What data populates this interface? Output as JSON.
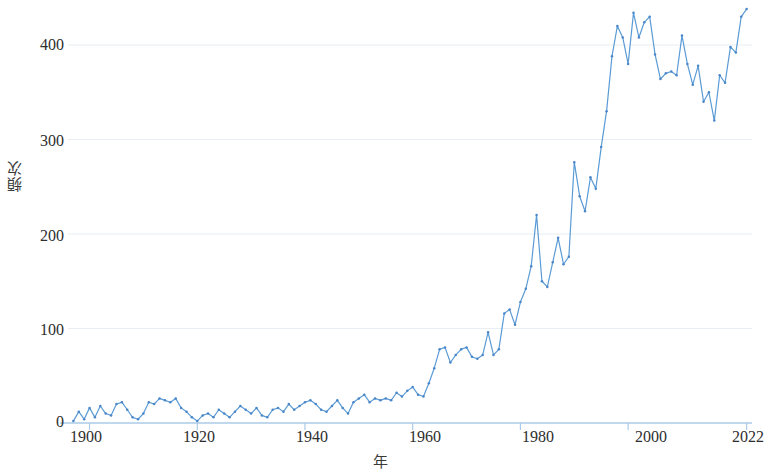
{
  "chart_data": {
    "type": "line",
    "title": "",
    "xlabel": "年",
    "ylabel": "頻次",
    "xlim": [
      1896,
      2023
    ],
    "ylim": [
      0,
      445
    ],
    "grid": true,
    "grid_axis": "y",
    "legend": null,
    "line_color": "#5b9bd5",
    "marker_color": "#4a86c8",
    "axis_color": "#aacbe8",
    "x_ticks": [
      1900,
      1920,
      1940,
      1960,
      1980,
      2000,
      2022
    ],
    "y_ticks": [
      0,
      100,
      200,
      300,
      400
    ],
    "series": [
      {
        "name": "頻次",
        "x": [
          1897,
          1898,
          1899,
          1900,
          1901,
          1902,
          1903,
          1904,
          1905,
          1906,
          1907,
          1908,
          1909,
          1910,
          1911,
          1912,
          1913,
          1914,
          1915,
          1916,
          1917,
          1918,
          1919,
          1920,
          1921,
          1922,
          1923,
          1924,
          1925,
          1926,
          1927,
          1928,
          1929,
          1930,
          1931,
          1932,
          1933,
          1934,
          1935,
          1936,
          1937,
          1938,
          1939,
          1940,
          1941,
          1942,
          1943,
          1944,
          1945,
          1946,
          1947,
          1948,
          1949,
          1950,
          1951,
          1952,
          1953,
          1954,
          1955,
          1956,
          1957,
          1958,
          1959,
          1960,
          1961,
          1962,
          1963,
          1964,
          1965,
          1966,
          1967,
          1968,
          1969,
          1970,
          1971,
          1972,
          1973,
          1974,
          1975,
          1976,
          1977,
          1978,
          1979,
          1980,
          1981,
          1982,
          1983,
          1984,
          1985,
          1986,
          1987,
          1988,
          1989,
          1990,
          1991,
          1992,
          1993,
          1994,
          1995,
          1996,
          1997,
          1998,
          1999,
          2000,
          2001,
          2002,
          2003,
          2004,
          2005,
          2006,
          2007,
          2008,
          2009,
          2010,
          2011,
          2012,
          2013,
          2014,
          2015,
          2016,
          2017,
          2018,
          2019,
          2020,
          2021,
          2022
        ],
        "values": [
          2,
          12,
          4,
          16,
          6,
          18,
          10,
          8,
          20,
          22,
          14,
          6,
          4,
          10,
          22,
          20,
          26,
          24,
          22,
          26,
          16,
          12,
          6,
          2,
          8,
          10,
          6,
          14,
          10,
          6,
          12,
          18,
          14,
          10,
          16,
          8,
          6,
          14,
          16,
          12,
          20,
          14,
          18,
          22,
          24,
          20,
          14,
          12,
          18,
          24,
          16,
          10,
          22,
          26,
          30,
          22,
          26,
          24,
          26,
          24,
          32,
          28,
          34,
          38,
          30,
          28,
          42,
          58,
          78,
          80,
          64,
          72,
          78,
          80,
          70,
          68,
          72,
          96,
          72,
          78,
          116,
          120,
          104,
          128,
          142,
          166,
          220,
          150,
          144,
          170,
          196,
          168,
          176,
          276,
          240,
          224,
          260,
          248,
          292,
          330,
          388,
          420,
          408,
          380,
          434,
          408,
          424,
          430,
          390,
          364,
          370,
          372,
          368,
          410,
          380,
          358,
          378,
          340,
          350,
          320,
          368,
          360,
          398,
          392,
          430,
          438
        ]
      }
    ]
  },
  "axis": {
    "y_tick_labels": [
      "400",
      "300",
      "200",
      "100",
      "0"
    ],
    "x_tick_labels": [
      "1900",
      "1920",
      "1940",
      "1960",
      "1980",
      "2000",
      "2022"
    ]
  }
}
